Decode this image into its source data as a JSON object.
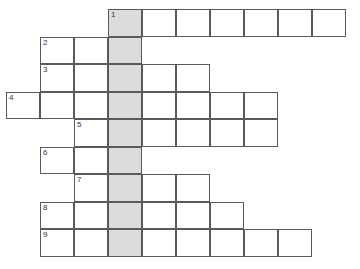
{
  "puzzle": {
    "kind": "crossword-grid",
    "title": "",
    "rows": 9,
    "columns": 10,
    "cell_width": 34,
    "cell_height": 27.5,
    "origin_x": 6,
    "origin_y": 9,
    "colors": {
      "background": "#ffffff",
      "cell_fill": "#ffffff",
      "shaded_fill": "#dcdcdc",
      "border": "#5a5a5a",
      "number_text": "#333333"
    },
    "highlight_column": 3,
    "numbers": [
      "1",
      "2",
      "3",
      "4",
      "5",
      "6",
      "7",
      "8",
      "9"
    ],
    "entries": [
      {
        "number": "1",
        "row": 1,
        "start_col": 3,
        "length": 7,
        "cells": [
          "1",
          "",
          "",
          "",
          "",
          "",
          ""
        ]
      },
      {
        "number": "2",
        "row": 2,
        "start_col": 1,
        "length": 3,
        "cells": [
          "2",
          "",
          ""
        ]
      },
      {
        "number": "3",
        "row": 3,
        "start_col": 1,
        "length": 5,
        "cells": [
          "3",
          "",
          "",
          "",
          ""
        ]
      },
      {
        "number": "4",
        "row": 4,
        "start_col": 0,
        "length": 8,
        "cells": [
          "4",
          "",
          "",
          "",
          "",
          "",
          "",
          ""
        ]
      },
      {
        "number": "5",
        "row": 5,
        "start_col": 2,
        "length": 6,
        "cells": [
          "5",
          "",
          "",
          "",
          "",
          ""
        ]
      },
      {
        "number": "6",
        "row": 6,
        "start_col": 1,
        "length": 3,
        "cells": [
          "6",
          "",
          ""
        ]
      },
      {
        "number": "7",
        "row": 7,
        "start_col": 2,
        "length": 4,
        "cells": [
          "7",
          "",
          "",
          ""
        ]
      },
      {
        "number": "8",
        "row": 8,
        "start_col": 1,
        "length": 6,
        "cells": [
          "8",
          "",
          "",
          "",
          "",
          ""
        ]
      },
      {
        "number": "9",
        "row": 9,
        "start_col": 1,
        "length": 8,
        "cells": [
          "9",
          "",
          "",
          "",
          "",
          "",
          "",
          ""
        ]
      }
    ]
  }
}
